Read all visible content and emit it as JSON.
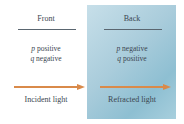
{
  "diagram": {
    "columns": [
      {
        "id": "front",
        "heading": "Front",
        "lines": [
          {
            "var": "p",
            "text": " positive"
          },
          {
            "var": "q",
            "text": " negative"
          }
        ],
        "caption": "Incident light"
      },
      {
        "id": "back",
        "heading": "Back",
        "lines": [
          {
            "var": "p",
            "text": " negative"
          },
          {
            "var": "q",
            "text": " positive"
          }
        ],
        "caption": "Refracted light"
      }
    ],
    "colors": {
      "panel": "#a9ccdb",
      "arrow": "#d98a4a",
      "text": "#3b4650"
    },
    "icons": [
      "arrow-right-icon",
      "arrow-right-icon"
    ]
  }
}
